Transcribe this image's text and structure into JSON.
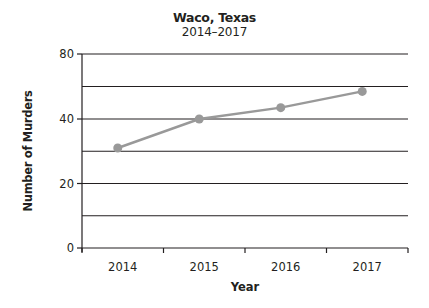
{
  "chart_data": {
    "type": "line",
    "title": "Waco, Texas",
    "subtitle": "2014–2017",
    "xlabel": "Year",
    "ylabel": "Number of Murders",
    "categories": [
      "2014",
      "2015",
      "2016",
      "2017"
    ],
    "series": [
      {
        "name": "Number of Murders",
        "values": [
          31,
          40,
          47,
          57
        ],
        "color": "#999999"
      }
    ],
    "y_tick_labels": [
      "0",
      "20",
      "40",
      "80"
    ],
    "y_gridlines": [
      0,
      10,
      20,
      30,
      40,
      60,
      80
    ],
    "ylim": [
      0,
      80
    ],
    "grid": true,
    "legend": "none",
    "note": "Y axis is non-uniform: 0–40 in steps of 10 per gridline, 40–80 in steps of 20 per gridline"
  }
}
